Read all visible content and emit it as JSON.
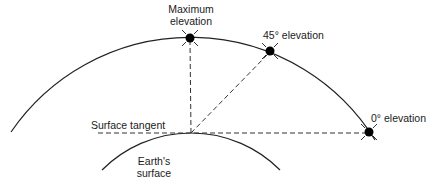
{
  "diagram": {
    "labels": {
      "max_elevation": [
        "Maximum",
        "elevation"
      ],
      "elevation_45": "45° elevation",
      "elevation_0": "0° elevation",
      "surface_tangent": "Surface tangent",
      "earth_surface": [
        "Earth's",
        "surface"
      ]
    },
    "colors": {
      "line": "#222222",
      "dot": "#000000",
      "background": "#ffffff"
    },
    "points": {
      "max_elevation": [
        190,
        38
      ],
      "elevation_45": [
        270,
        51
      ],
      "elevation_0": [
        369,
        132
      ],
      "tangent_point": [
        191,
        133
      ]
    }
  }
}
